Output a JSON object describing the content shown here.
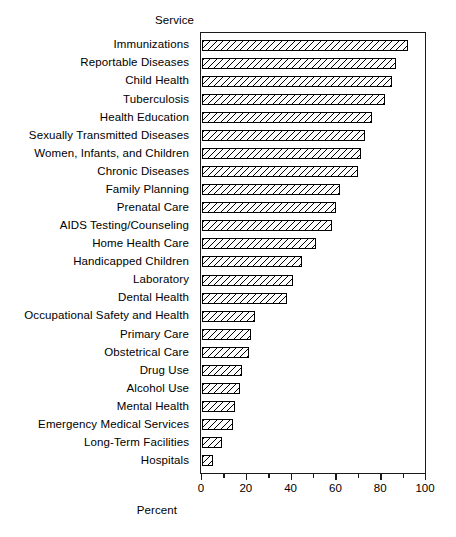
{
  "chart_data": {
    "type": "bar",
    "orientation": "horizontal",
    "title": "",
    "subtitle": "",
    "category_axis_label": "Service",
    "xlabel": "Percent",
    "ylabel": "Service",
    "xlim": [
      0,
      100
    ],
    "xticks": [
      0,
      20,
      40,
      60,
      80,
      100
    ],
    "xtick_labels": [
      "0",
      "20",
      "40",
      "60",
      "80",
      "100"
    ],
    "minor_xticks": [
      10,
      30,
      50,
      70,
      90
    ],
    "grid": false,
    "legend": null,
    "bar_style": {
      "fill": "diagonal-hatch",
      "edge_color": "#000000",
      "face_color": "#ffffff"
    },
    "categories": [
      "Immunizations",
      "Reportable Diseases",
      "Child Health",
      "Tuberculosis",
      "Health Education",
      "Sexually Transmitted Diseases",
      "Women, Infants, and Children",
      "Chronic Diseases",
      "Family Planning",
      "Prenatal Care",
      "AIDS Testing/Counseling",
      "Home Health Care",
      "Handicapped Children",
      "Laboratory",
      "Dental Health",
      "Occupational Safety and Health",
      "Primary Care",
      "Obstetrical Care",
      "Drug Use",
      "Alcohol Use",
      "Mental Health",
      "Emergency Medical Services",
      "Long-Term Facilities",
      "Hospitals"
    ],
    "values": [
      92,
      87,
      85,
      82,
      76,
      73,
      71,
      70,
      62,
      60,
      58,
      51,
      45,
      41,
      38,
      24,
      22,
      21,
      18,
      17,
      15,
      14,
      9,
      5
    ]
  }
}
